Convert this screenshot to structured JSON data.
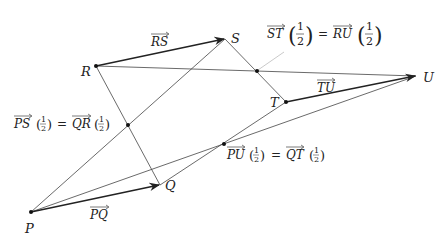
{
  "diagram": {
    "points": {
      "P": {
        "label": "P",
        "x": 31,
        "y": 212
      },
      "Q": {
        "label": "Q",
        "x": 160,
        "y": 185
      },
      "R": {
        "label": "R",
        "x": 96,
        "y": 66
      },
      "S": {
        "label": "S",
        "x": 225,
        "y": 39
      },
      "T": {
        "label": "T",
        "x": 286,
        "y": 102
      },
      "U": {
        "label": "U",
        "x": 416,
        "y": 76
      },
      "M1": {
        "x": 128,
        "y": 125
      },
      "M2": {
        "x": 257,
        "y": 71
      },
      "M3": {
        "x": 224,
        "y": 144
      }
    },
    "vector_labels": {
      "RS": "RS",
      "TU": "TU",
      "PQ": "PQ"
    },
    "equations": {
      "left": {
        "lhs": "PS",
        "rhs": "QR",
        "num": "1",
        "den": "2"
      },
      "top": {
        "lhs": "ST",
        "rhs": "RU",
        "num": "1",
        "den": "2"
      },
      "bottom": {
        "lhs": "PU",
        "rhs": "QT",
        "num": "1",
        "den": "2"
      }
    },
    "equals": "=",
    "colors": {
      "line": "#444444",
      "thick": "#222222",
      "callout": "#bbbbbb"
    }
  }
}
